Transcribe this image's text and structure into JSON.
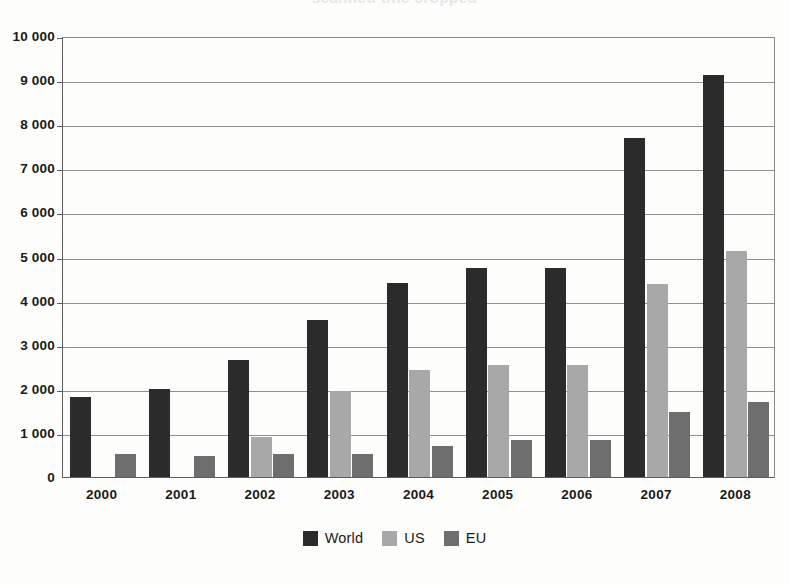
{
  "chart_data": {
    "type": "bar",
    "title": "",
    "xlabel": "",
    "ylabel": "",
    "ylim": [
      0,
      10000
    ],
    "ytick_step": 1000,
    "grid": true,
    "legend_position": "bottom-center",
    "categories": [
      "2000",
      "2001",
      "2002",
      "2003",
      "2004",
      "2005",
      "2006",
      "2007",
      "2008"
    ],
    "ytick_labels": [
      "10 000",
      "9 000",
      "8 000",
      "7 000",
      "6 000",
      "5 000",
      "4 000",
      "3 000",
      "2 000",
      "1 000",
      "0"
    ],
    "series": [
      {
        "name": "World",
        "color": "#2b2b2b",
        "values": [
          1820,
          1990,
          2660,
          3550,
          4400,
          4750,
          4750,
          7680,
          9110
        ]
      },
      {
        "name": "US",
        "color": "#a8a8a8",
        "values": [
          null,
          null,
          900,
          1940,
          2420,
          2540,
          2540,
          4380,
          5120
        ]
      },
      {
        "name": "EU",
        "color": "#6e6e6e",
        "values": [
          520,
          470,
          520,
          520,
          700,
          840,
          840,
          1470,
          1700
        ]
      }
    ]
  },
  "legend": {
    "items": [
      {
        "label": "World",
        "color": "#2b2b2b",
        "icon": "square-swatch-icon"
      },
      {
        "label": "US",
        "color": "#a8a8a8",
        "icon": "square-swatch-icon"
      },
      {
        "label": "EU",
        "color": "#6e6e6e",
        "icon": "square-swatch-icon"
      }
    ]
  },
  "title_remnant": "scanned title cropped"
}
